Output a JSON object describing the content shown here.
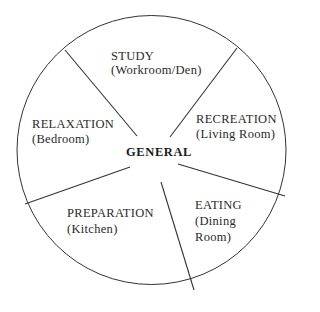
{
  "diagram": {
    "center_label": "GENERAL",
    "segments": [
      {
        "title": "STUDY",
        "sub": [
          "(Workroom/Den)"
        ]
      },
      {
        "title": "RECREATION",
        "sub": [
          "(Living Room)"
        ]
      },
      {
        "title": "EATING",
        "sub": [
          "(Dining",
          "Room)"
        ]
      },
      {
        "title": "PREPARATION",
        "sub": [
          "(Kitchen)"
        ]
      },
      {
        "title": "RELAXATION",
        "sub": [
          "(Bedroom)"
        ]
      }
    ],
    "colors": {
      "line": "#333333",
      "background": "#ffffff"
    }
  }
}
